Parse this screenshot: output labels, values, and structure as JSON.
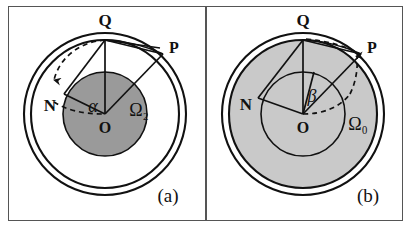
{
  "figure": {
    "background_color": "#ffffff",
    "frame_color": "#555555",
    "width": 411,
    "height": 230
  },
  "panels": [
    {
      "tag": "(a)",
      "name": "panel-a",
      "outer_ring": {
        "outer_radius": 80,
        "inner_radius": 73,
        "fill": "#ffffff",
        "stroke": "#111111"
      },
      "inner_disk": {
        "radius": 42,
        "fill": "#9a9a9a",
        "stroke": "#111111",
        "label": "Ω₂"
      },
      "angle_label": "α",
      "omega_label": "Ω₂",
      "points": [
        {
          "id": "Q",
          "label": "Q"
        },
        {
          "id": "P",
          "label": "P"
        },
        {
          "id": "N",
          "label": "N"
        },
        {
          "id": "O",
          "label": "O"
        }
      ],
      "dashed_arc": {
        "direction": "downward",
        "arrow_at": "N",
        "style": "dashed"
      }
    },
    {
      "tag": "(b)",
      "name": "panel-b",
      "outer_ring": {
        "outer_radius": 80,
        "inner_radius": 73,
        "fill": "#c9c9c9",
        "stroke": "#111111"
      },
      "inner_disk": {
        "radius": 42,
        "fill": "#c9c9c9",
        "stroke": "#111111",
        "label": "Ω₀"
      },
      "angle_label": "β",
      "omega_label": "Ω₀",
      "points": [
        {
          "id": "Q",
          "label": "Q"
        },
        {
          "id": "P",
          "label": "P"
        },
        {
          "id": "N",
          "label": "N"
        },
        {
          "id": "O",
          "label": "O"
        }
      ],
      "dashed_arc": {
        "direction": "upward",
        "arrow_at": "P",
        "style": "dashed"
      }
    }
  ],
  "colors": {
    "line": "#111111",
    "dark_gray_fill": "#9a9a9a",
    "light_gray_fill": "#c9c9c9",
    "frame": "#555555",
    "white": "#ffffff"
  }
}
